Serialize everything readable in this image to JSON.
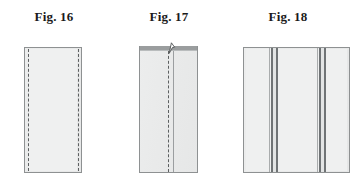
{
  "figure_sheet": {
    "background_color": "#ffffff",
    "caption_color": "#1b1b1b",
    "panel_fill": "#eceded",
    "panel_outline": "#8e9192",
    "stitch_color": "#5c5f60",
    "band_color": "#6f7375",
    "figures": [
      {
        "caption": "Fig. 16",
        "id": "fig-16",
        "description": "flat rectangular fabric panel with dashed stitching lines inset from the left and right edges",
        "geometry": {
          "x": 24,
          "y": 47,
          "width": 58,
          "height": 126
        },
        "stitch_lines": [
          {
            "name": "left-stitch-line",
            "x_offset": 3
          },
          {
            "name": "right-stitch-line",
            "x_offset": 54
          }
        ]
      },
      {
        "caption": "Fig. 17",
        "id": "fig-17",
        "description": "panel folded over on itself, dark top edge cap, a small lifted flap at the top centre, a dashed stitching line on the fold and a solid fold edge beside it",
        "geometry": {
          "x": 139,
          "y": 46,
          "width": 59,
          "height": 127
        },
        "top_cap": {
          "name": "top-edge-cap",
          "height": 4
        },
        "stitch_lines": [
          {
            "name": "centre-stitch-line",
            "x_offset": 29
          }
        ],
        "fold_lines": [
          {
            "name": "fold-edge-line",
            "x_offset": 33
          }
        ],
        "flap": {
          "name": "lifted-corner-flap",
          "x_offset": 29
        }
      },
      {
        "caption": "Fig. 18",
        "id": "fig-18",
        "description": "wide finished panel showing two pleat bands, each band made of paired dark vertical rules",
        "geometry": {
          "x": 243,
          "y": 47,
          "width": 107,
          "height": 126
        },
        "bands": [
          {
            "name": "left-pleat-band",
            "x_offset": 26,
            "rules": [
              {
                "name": "band-rule-outer",
                "x": 0,
                "width": 1,
                "tone": "soft"
              },
              {
                "name": "band-rule-inner",
                "x": 2,
                "width": 2,
                "tone": "dark"
              },
              {
                "name": "band-gap",
                "x": 4,
                "width": 3,
                "tone": "gap"
              },
              {
                "name": "band-rule-fold",
                "x": 7,
                "width": 2,
                "tone": "dark"
              }
            ]
          },
          {
            "name": "right-pleat-band",
            "x_offset": 74,
            "rules": [
              {
                "name": "band-rule-outer",
                "x": 0,
                "width": 1,
                "tone": "soft"
              },
              {
                "name": "band-rule-inner",
                "x": 2,
                "width": 2,
                "tone": "dark"
              },
              {
                "name": "band-gap",
                "x": 4,
                "width": 3,
                "tone": "gap"
              },
              {
                "name": "band-rule-fold",
                "x": 7,
                "width": 2,
                "tone": "dark"
              }
            ]
          }
        ]
      }
    ]
  }
}
